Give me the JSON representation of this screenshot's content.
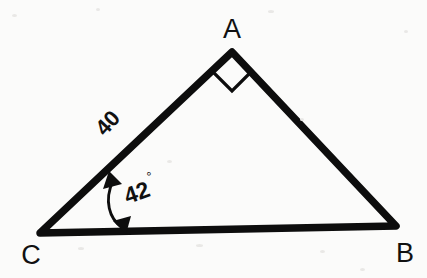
{
  "figure": {
    "type": "geometry-diagram",
    "shape": "right triangle",
    "background_color": "#fbfbfa",
    "ink_color": "#0d0d0d",
    "vertices": [
      {
        "name": "A",
        "label": "A",
        "x": 232,
        "y": 52,
        "label_x": 232,
        "label_y": 38
      },
      {
        "name": "B",
        "label": "B",
        "x": 396,
        "y": 226,
        "label_x": 405,
        "label_y": 261
      },
      {
        "name": "C",
        "label": "C",
        "x": 40,
        "y": 233,
        "label_x": 31,
        "label_y": 263
      }
    ],
    "sides": [
      {
        "name": "CA",
        "from": "C",
        "to": "A",
        "label": "40",
        "label_x": 113,
        "label_y": 128,
        "label_rotation": -47
      },
      {
        "name": "AB",
        "from": "A",
        "to": "B",
        "label": "",
        "label_x": 0,
        "label_y": 0,
        "label_rotation": 0
      },
      {
        "name": "CB",
        "from": "C",
        "to": "B",
        "label": "",
        "label_x": 0,
        "label_y": 0,
        "label_rotation": 0
      }
    ],
    "angles": [
      {
        "at": "A",
        "value": "90",
        "marker": "right-angle-square",
        "label": ""
      },
      {
        "at": "C",
        "value": "42",
        "marker": "double-headed-arc-arrow",
        "label": "42",
        "degree_symbol": "°",
        "label_x": 132,
        "label_y": 196,
        "label_rotation": -20
      }
    ],
    "right_angle_marker": {
      "points": "232,53 213,72 232,91 251,72"
    },
    "angle_arrow": {
      "path": "M 113,180 C 104,200 108,220 122,228",
      "head_top": "110,172 121,183 104,188",
      "head_bottom": "124,232 114,220 131,217"
    }
  }
}
